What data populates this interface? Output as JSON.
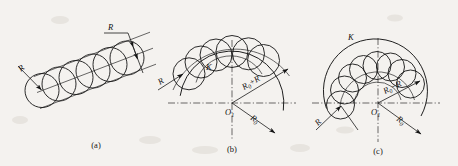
{
  "figure": {
    "background_color": "#f4f2ef",
    "ink_color": "#141414",
    "width": 458,
    "height": 166
  },
  "panels": [
    {
      "id": "a",
      "caption": "(a)",
      "description": "Chain of equal circles tangent along a straight inclined band",
      "labels": {
        "radius_left": "R",
        "radius_right": "R"
      },
      "geometry": {
        "type": "straight-band",
        "circle_count": 6,
        "circle_radius": 17,
        "band_angle_deg": -21,
        "axis_start": [
          38,
          92
        ],
        "axis_end": [
          140,
          53
        ]
      }
    },
    {
      "id": "b",
      "caption": "(b)",
      "description": "Chain of equal circles straddling a convex arc, centers on radius R0+R",
      "labels": {
        "radius_small": "R",
        "tangent_point": "K",
        "center": "O",
        "center_sub": "1",
        "outer_radius": "R",
        "outer_radius_sub": "0",
        "outer_radius_tail": "+R",
        "base_radius": "R",
        "base_radius_sub": "0"
      },
      "geometry": {
        "type": "convex-arc",
        "circle_count": 6,
        "circle_radius": 16,
        "base_radius": 52,
        "center": [
          232,
          103
        ],
        "arc_start_deg": 188,
        "arc_end_deg": 352
      }
    },
    {
      "id": "c",
      "caption": "(c)",
      "description": "Chain of equal circles inside a concave arc, centers on radius R0-R",
      "labels": {
        "radius_small": "R",
        "tangent_point": "K",
        "center": "O",
        "center_sub": "1",
        "inner_radius": "R",
        "inner_radius_sub": "0",
        "inner_radius_tail": "−R",
        "base_radius": "R",
        "base_radius_sub": "0"
      },
      "geometry": {
        "type": "concave-arc",
        "circle_count": 8,
        "circle_radius": 14,
        "base_radius": 52,
        "center": [
          378,
          103
        ],
        "arc_start_deg": 178,
        "arc_end_deg": 368
      }
    }
  ]
}
